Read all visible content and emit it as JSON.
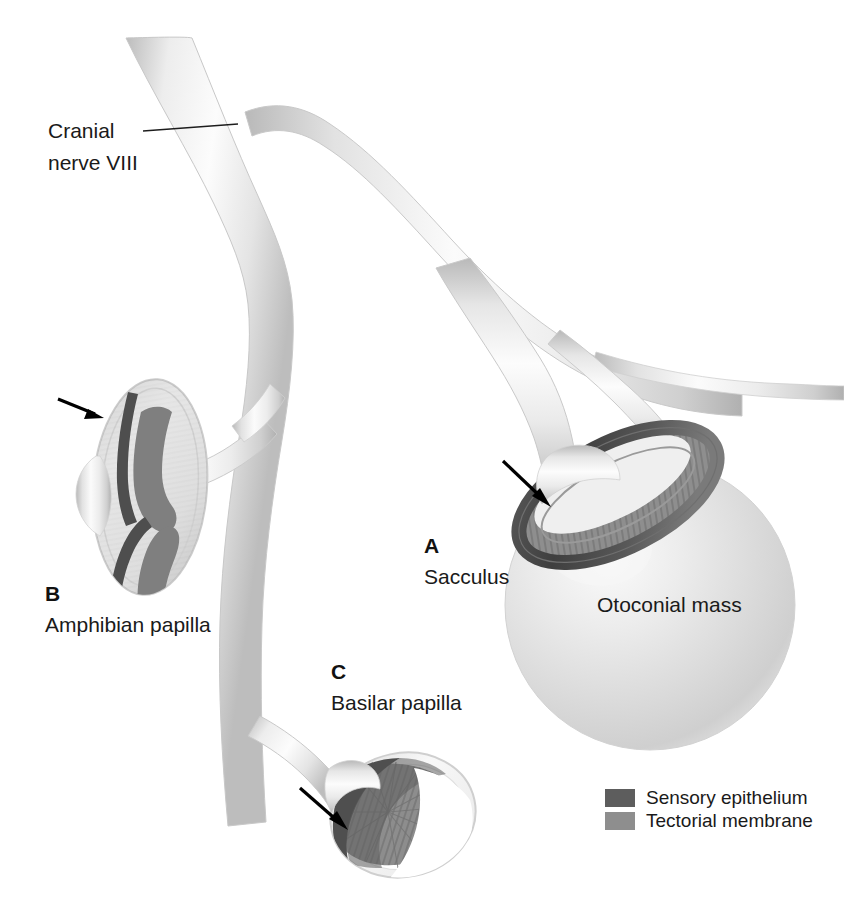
{
  "figure": {
    "background_color": "#ffffff"
  },
  "labels": {
    "cranial_nerve_line1": "Cranial",
    "cranial_nerve_line2": "nerve VIII",
    "panel_a_letter": "A",
    "panel_a_name": "Sacculus",
    "panel_b_letter": "B",
    "panel_b_name": "Amphibian papilla",
    "panel_c_letter": "C",
    "panel_c_name": "Basilar papilla",
    "otoconial_mass": "Otoconial mass"
  },
  "legend": {
    "items": [
      {
        "label": "Sensory epithelium",
        "color": "#5d5d5d"
      },
      {
        "label": "Tectorial membrane",
        "color": "#8e8e8e"
      }
    ]
  },
  "colors": {
    "nerve_light": "#f4f4f4",
    "nerve_mid": "#d8d8d8",
    "nerve_shadow": "#b4b4b4",
    "sensory_epithelium": "#5d5d5d",
    "sensory_epithelium_dark": "#474747",
    "tectorial_membrane": "#8e8e8e",
    "tectorial_membrane_light": "#a6a6a6",
    "otoconial_mass": "#dcdcdc",
    "otoconial_mass_highlight": "#f2f2f2",
    "text": "#1a1a1a",
    "arrow": "#000000"
  },
  "annotations": {
    "arrow_count": 3,
    "arrow_targets": [
      "amphibian-papilla",
      "sacculus",
      "basilar-papilla"
    ]
  }
}
